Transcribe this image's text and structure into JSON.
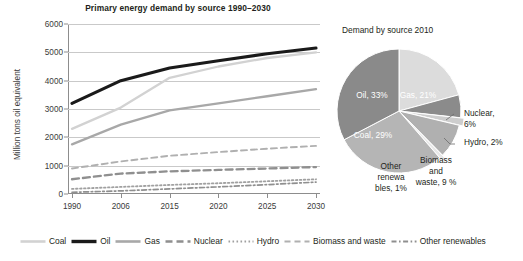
{
  "chart_data": [
    {
      "type": "line",
      "title": "Primary energy demand by source 1990–2030",
      "xlabel": "",
      "ylabel": "Million tons oil equivalent",
      "x": [
        "1990",
        "2006",
        "2015",
        "2020",
        "2025",
        "2030"
      ],
      "yticks": [
        0,
        1000,
        2000,
        3000,
        4000,
        5000,
        6000
      ],
      "ylim": [
        0,
        6000
      ],
      "grid": true,
      "legend_position": "bottom",
      "series": [
        {
          "name": "Coal",
          "values": [
            2300,
            3050,
            4100,
            4500,
            4800,
            5000
          ],
          "color": "#d2d2d2",
          "style": "solid",
          "width": 2.3
        },
        {
          "name": "Oil",
          "values": [
            3200,
            4000,
            4450,
            4700,
            4950,
            5150
          ],
          "color": "#1a1a1a",
          "style": "solid",
          "width": 3.1
        },
        {
          "name": "Gas",
          "values": [
            1750,
            2450,
            2950,
            3200,
            3450,
            3700
          ],
          "color": "#a8a8a8",
          "style": "solid",
          "width": 2.3
        },
        {
          "name": "Nuclear",
          "values": [
            520,
            720,
            800,
            850,
            900,
            950
          ],
          "color": "#8f8f8f",
          "style": "dashed",
          "width": 2.3
        },
        {
          "name": "Hydro",
          "values": [
            180,
            250,
            320,
            380,
            450,
            520
          ],
          "color": "#a0a0a0",
          "style": "dotted",
          "width": 1.8
        },
        {
          "name": "Biomass and waste",
          "values": [
            900,
            1150,
            1350,
            1480,
            1600,
            1700
          ],
          "color": "#b0b0b0",
          "style": "dashed",
          "width": 1.9
        },
        {
          "name": "Other renewables",
          "values": [
            60,
            110,
            180,
            250,
            330,
            420
          ],
          "color": "#8f8f8f",
          "style": "dashdot",
          "width": 1.7
        }
      ]
    },
    {
      "type": "pie",
      "title": "Demand by source 2010",
      "labels": [
        "Gas",
        "Nuclear",
        "Hydro",
        "Biomass and waste",
        "Other renewables",
        "Coal",
        "Oil"
      ],
      "values": [
        21,
        6,
        2,
        9,
        1,
        29,
        33
      ],
      "label_texts": [
        "Gas, 21%",
        "Nuclear,\n6%",
        "Hydro, 2%",
        "Biomass\nand\nwaste, 9 %",
        "Other\nrenewa\nbles, 1%",
        "Coal, 29%",
        "Oil, 33%"
      ],
      "colors": [
        "#dcdcdc",
        "#8b8b8b",
        "#cdcdcd",
        "#b0b0b0",
        "#e8e8e8",
        "#b5b5b5",
        "#8a8a8a"
      ]
    }
  ],
  "line_chart": {
    "title": "Primary energy demand by source 1990–2030",
    "ylabel": "Million tons oil equivalent",
    "yticks": [
      "6000",
      "5000",
      "4000",
      "3000",
      "2000",
      "1000",
      "0"
    ],
    "xticks": [
      "1990",
      "2006",
      "2015",
      "2020",
      "2025",
      "2030"
    ]
  },
  "legend": {
    "items": [
      {
        "label": "Coal",
        "icon": "line-swatch-solid-light"
      },
      {
        "label": "Oil",
        "icon": "line-swatch-solid-black"
      },
      {
        "label": "Gas",
        "icon": "line-swatch-solid-gray"
      },
      {
        "label": "Nuclear",
        "icon": "line-swatch-dashed"
      },
      {
        "label": "Hydro",
        "icon": "line-swatch-dotted"
      },
      {
        "label": "Biomass and waste",
        "icon": "line-swatch-dashed-long"
      },
      {
        "label": "Other renewables",
        "icon": "line-swatch-dashdot"
      }
    ]
  },
  "pie_chart": {
    "title": "Demand by source 2010",
    "inside_labels": [
      {
        "name": "oil",
        "text": "Oil, 33%"
      },
      {
        "name": "gas",
        "text": "Gas, 21%"
      },
      {
        "name": "coal",
        "text": "Coal, 29%"
      }
    ],
    "outside_labels": [
      {
        "name": "nuclear",
        "lines": [
          "Nuclear,",
          "6%"
        ]
      },
      {
        "name": "hydro",
        "lines": [
          "Hydro, 2%"
        ]
      },
      {
        "name": "biomass",
        "lines": [
          "Biomass",
          "and",
          "waste, 9 %"
        ]
      },
      {
        "name": "other-renewables",
        "lines": [
          "Other",
          "renewa",
          "bles, 1%"
        ]
      }
    ]
  }
}
